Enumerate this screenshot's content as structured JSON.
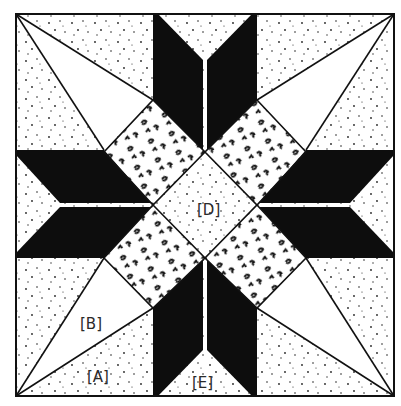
{
  "diagram": {
    "type": "quilt-block",
    "colors": {
      "background": "#ffffff",
      "solid_fabric": "#0d0d0d",
      "line": "#111111",
      "label": "#2a2a2a"
    },
    "outer_square": {
      "x1": 16,
      "y1": 14,
      "x2": 394,
      "y2": 396
    },
    "labels": {
      "A": "[A]",
      "B": "[B]",
      "D": "[D]",
      "E": "[E]"
    },
    "pieces": {
      "A": "corner triangle (speckled background fabric)",
      "B": "long kite triangle (plain white)",
      "D": "center diamond (speckled fabric)",
      "E": "edge triangle between star points (speckled fabric)",
      "star_points": "eight black parallelogram star points",
      "patterned_squares": "four diamonds with swirl print fabric"
    }
  }
}
